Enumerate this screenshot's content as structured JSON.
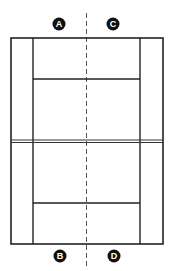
{
  "diagram": {
    "type": "tennis-court-top-view",
    "colors": {
      "background": "#ffffff",
      "lines": "#222222",
      "center_dash": "#555555",
      "marker_fill": "#111111",
      "marker_text": "#ffffff"
    },
    "markers": [
      {
        "id": "A",
        "label": "A",
        "position": "top-left"
      },
      {
        "id": "C",
        "label": "C",
        "position": "top-right"
      },
      {
        "id": "B",
        "label": "B",
        "position": "bottom-left"
      },
      {
        "id": "D",
        "label": "D",
        "position": "bottom-right"
      }
    ]
  }
}
